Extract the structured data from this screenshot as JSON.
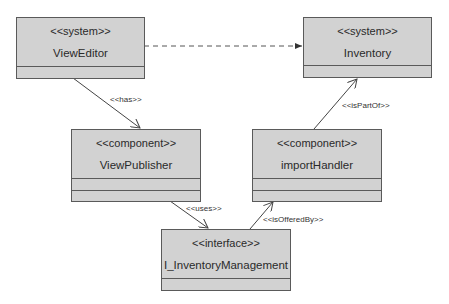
{
  "diagram": {
    "type": "UML component diagram",
    "colors": {
      "box_fill": "#d2d2d2",
      "border": "#5a5a5a",
      "line": "#444444",
      "background": "#ffffff"
    },
    "nodes": [
      {
        "id": "viewEditor",
        "stereotype": "<<system>>",
        "name": "ViewEditor",
        "compartments": 1
      },
      {
        "id": "inventory",
        "stereotype": "<<system>>",
        "name": "Inventory",
        "compartments": 1
      },
      {
        "id": "viewPublisher",
        "stereotype": "<<component>>",
        "name": "ViewPublisher",
        "compartments": 2
      },
      {
        "id": "importHandler",
        "stereotype": "<<component>>",
        "name": "importHandler",
        "compartments": 2
      },
      {
        "id": "iInventoryManagement",
        "stereotype": "<<interface>>",
        "name": "I_InventoryManagement",
        "compartments": 1
      }
    ],
    "edges": [
      {
        "from": "viewEditor",
        "to": "inventory",
        "style": "dashed",
        "label": ""
      },
      {
        "from": "viewEditor",
        "to": "viewPublisher",
        "style": "solid",
        "label": "<<has>>"
      },
      {
        "from": "viewPublisher",
        "to": "iInventoryManagement",
        "style": "solid",
        "label": "<<uses>>"
      },
      {
        "from": "iInventoryManagement",
        "to": "importHandler",
        "style": "solid",
        "label": "<<isOfferedBy>>"
      },
      {
        "from": "importHandler",
        "to": "inventory",
        "style": "solid",
        "label": "<<isPartOf>>"
      }
    ]
  }
}
